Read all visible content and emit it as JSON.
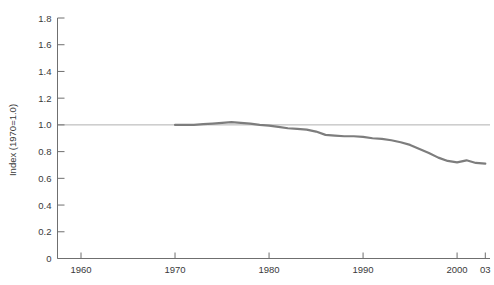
{
  "chart_data": {
    "type": "line",
    "title": "",
    "xlabel": "",
    "ylabel": "Index (1970=1.0)",
    "xlim": [
      1957.5,
      2003.5
    ],
    "ylim": [
      0,
      1.8
    ],
    "grid": false,
    "legend": null,
    "reference_line": {
      "axis": "y",
      "value": 1.0,
      "color": "#b0b0b0"
    },
    "series": [
      {
        "name": "Index",
        "color": "#7d7d7d",
        "x": [
          1970,
          1971,
          1972,
          1973,
          1974,
          1975,
          1976,
          1977,
          1978,
          1979,
          1980,
          1981,
          1982,
          1983,
          1984,
          1985,
          1986,
          1987,
          1988,
          1989,
          1990,
          1991,
          1992,
          1993,
          1994,
          1995,
          1996,
          1997,
          1998,
          1999,
          2000,
          2001,
          2002,
          2003
        ],
        "values": [
          1.0,
          1.0,
          1.0,
          1.005,
          1.01,
          1.015,
          1.02,
          1.015,
          1.01,
          1.0,
          0.995,
          0.985,
          0.975,
          0.97,
          0.965,
          0.95,
          0.925,
          0.92,
          0.915,
          0.915,
          0.91,
          0.9,
          0.895,
          0.885,
          0.87,
          0.85,
          0.82,
          0.79,
          0.755,
          0.73,
          0.72,
          0.735,
          0.715,
          0.71
        ]
      }
    ],
    "y_ticks": [
      0,
      0.2,
      0.4,
      0.6,
      0.8,
      1.0,
      1.2,
      1.4,
      1.6,
      1.8
    ],
    "y_tick_labels": [
      "0",
      "0.2",
      "0.4",
      "0.6",
      "0.8",
      "1.0",
      "1.2",
      "1.4",
      "1.6",
      "1.8"
    ],
    "x_ticks": [
      1960,
      1970,
      1980,
      1990,
      2000,
      2003
    ],
    "x_tick_labels": [
      "1960",
      "1970",
      "1980",
      "1990",
      "2000",
      "03"
    ]
  }
}
